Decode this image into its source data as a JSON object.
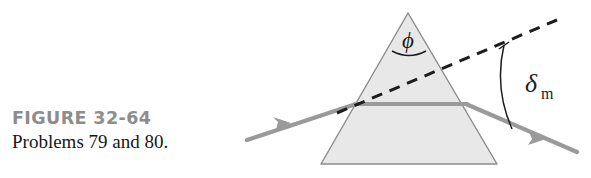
{
  "figure": {
    "label": "FIGURE 32-64",
    "caption": "Problems 79 and 80.",
    "label_color": "#8d8d8d",
    "caption_color": "#171717",
    "background_color": "#ffffff"
  },
  "diagram": {
    "prism": {
      "shape": "triangle",
      "fill_color": "#e8e8e8",
      "stroke_color": "#8a8a8a",
      "apex": {
        "x": 408,
        "y": 13
      },
      "base_left": {
        "x": 321,
        "y": 164
      },
      "base_right": {
        "x": 497,
        "y": 164
      }
    },
    "labels": {
      "apex_angle": "ϕ",
      "apex_angle_name": "phi",
      "deviation_angle_symbol": "δ",
      "deviation_angle_subscript": "m",
      "deviation_angle_name": "delta-m"
    },
    "rays": {
      "color": "#9a9a9a",
      "incident": {
        "from": {
          "x": 247,
          "y": 140
        },
        "to": {
          "x": 355,
          "y": 104
        },
        "arrow_at": {
          "x": 284,
          "y": 127
        }
      },
      "internal": {
        "from": {
          "x": 355,
          "y": 104
        },
        "to": {
          "x": 466,
          "y": 104
        }
      },
      "emergent": {
        "from": {
          "x": 466,
          "y": 104
        },
        "to": {
          "x": 576,
          "y": 152
        },
        "arrow_at": {
          "x": 537,
          "y": 135
        }
      }
    },
    "dashed_line": {
      "color": "#1d1d1d",
      "from": {
        "x": 337,
        "y": 113
      },
      "to": {
        "x": 557,
        "y": 20
      },
      "dash_pattern": "10 7"
    },
    "deviation_arc": {
      "color": "#1d1d1d",
      "from": {
        "x": 504,
        "y": 46
      },
      "to": {
        "x": 512,
        "y": 128
      }
    },
    "apex_arc": {
      "color": "#1d1d1d",
      "from": {
        "x": 392,
        "y": 50
      },
      "to": {
        "x": 426,
        "y": 50
      }
    }
  }
}
